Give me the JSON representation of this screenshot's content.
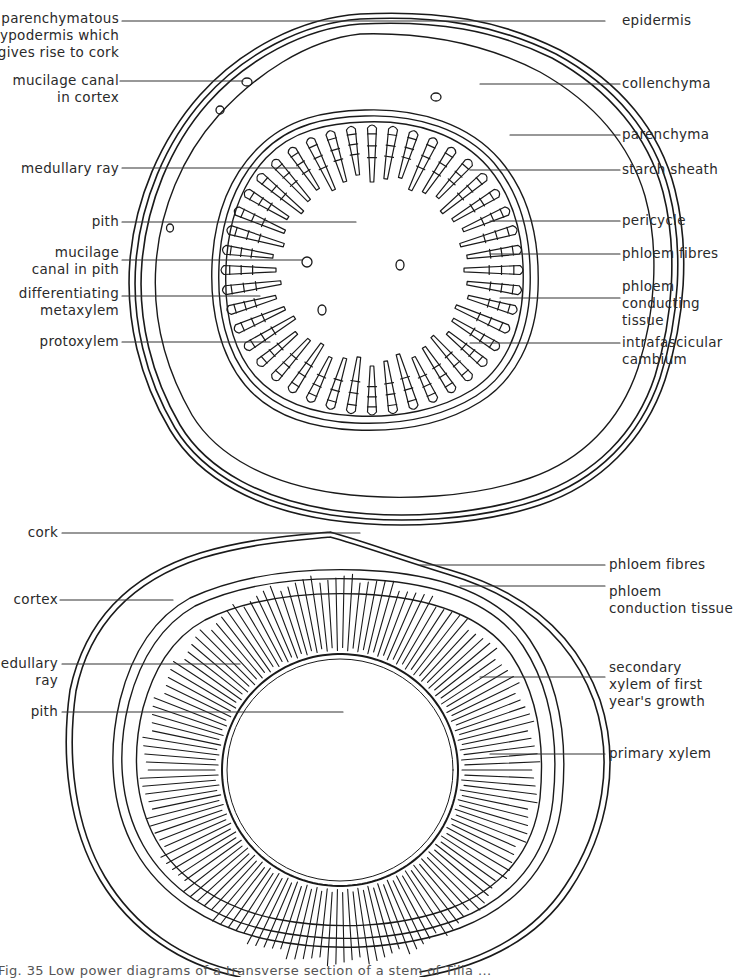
{
  "figure": {
    "caption": "Fig. 35  Low power diagrams of a transverse section of a stem of Tilia ...",
    "colors": {
      "ink": "#1a1a1a",
      "leader": "#333333",
      "background": "#ffffff"
    }
  },
  "top_diagram": {
    "subject": "young stem transverse section (primary structure)",
    "left_labels": [
      {
        "id": "hypodermis",
        "lines": [
          "parenchymatous",
          "hypodermis which",
          "gives rise to cork"
        ]
      },
      {
        "id": "mucilage-canal-cortex",
        "lines": [
          "mucilage canal",
          "in cortex"
        ]
      },
      {
        "id": "medullary-ray",
        "lines": [
          "medullary ray"
        ]
      },
      {
        "id": "pith",
        "lines": [
          "pith"
        ]
      },
      {
        "id": "mucilage-canal-pith",
        "lines": [
          "mucilage",
          "canal in pith"
        ]
      },
      {
        "id": "metaxylem",
        "lines": [
          "differentiating",
          "metaxylem"
        ]
      },
      {
        "id": "protoxylem",
        "lines": [
          "protoxylem"
        ]
      }
    ],
    "right_labels": [
      {
        "id": "epidermis",
        "lines": [
          "epidermis"
        ]
      },
      {
        "id": "collenchyma",
        "lines": [
          "collenchyma"
        ]
      },
      {
        "id": "parenchyma",
        "lines": [
          "parenchyma"
        ]
      },
      {
        "id": "starch-sheath",
        "lines": [
          "starch sheath"
        ]
      },
      {
        "id": "pericycle",
        "lines": [
          "pericycle"
        ]
      },
      {
        "id": "phloem-fibres",
        "lines": [
          "phloem fibres"
        ]
      },
      {
        "id": "phloem-conducting",
        "lines": [
          "phloem",
          "conducting",
          "tissue"
        ]
      },
      {
        "id": "cambium",
        "lines": [
          "intrafascicular",
          "cambium"
        ]
      }
    ]
  },
  "bottom_diagram": {
    "subject": "stem transverse section after first year's secondary growth",
    "left_labels": [
      {
        "id": "cork",
        "lines": [
          "cork"
        ]
      },
      {
        "id": "cortex",
        "lines": [
          "cortex"
        ]
      },
      {
        "id": "medullary-ray",
        "lines": [
          "medullary",
          "ray"
        ]
      },
      {
        "id": "pith",
        "lines": [
          "pith"
        ]
      }
    ],
    "right_labels": [
      {
        "id": "phloem-fibres",
        "lines": [
          "phloem fibres"
        ]
      },
      {
        "id": "phloem-conduction",
        "lines": [
          "phloem",
          "conduction tissue"
        ]
      },
      {
        "id": "secondary-xylem",
        "lines": [
          "secondary",
          "xylem of first",
          "year's growth"
        ]
      },
      {
        "id": "primary-xylem",
        "lines": [
          "primary xylem"
        ]
      }
    ]
  }
}
